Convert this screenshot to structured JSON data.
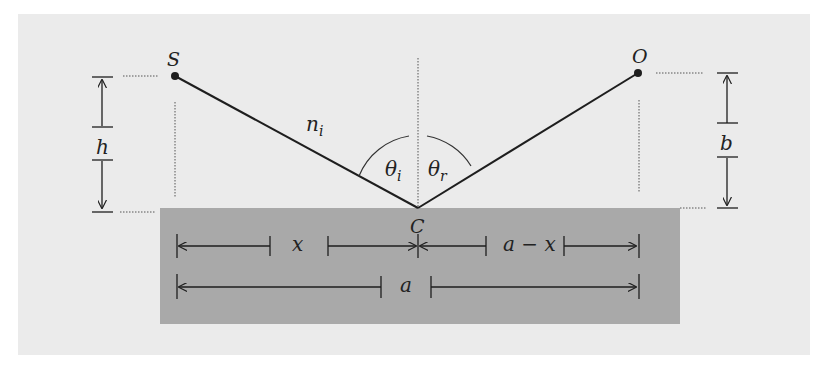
{
  "diagram": {
    "type": "reflection-geometry",
    "colors": {
      "panel": "#ebebeb",
      "surface": "#a9a9a9",
      "line": "#1e1e1e",
      "dotted": "#555555"
    },
    "points": {
      "source": "S",
      "observer": "O",
      "reflection_point": "C"
    },
    "labels": {
      "medium_index": "n",
      "medium_index_sub": "i",
      "angle_incident": "θ",
      "angle_incident_sub": "i",
      "angle_reflected": "θ",
      "angle_reflected_sub": "r",
      "height_source": "h",
      "height_observer": "b",
      "dist_x": "x",
      "dist_a_minus_x": "a − x",
      "dist_a": "a"
    }
  }
}
